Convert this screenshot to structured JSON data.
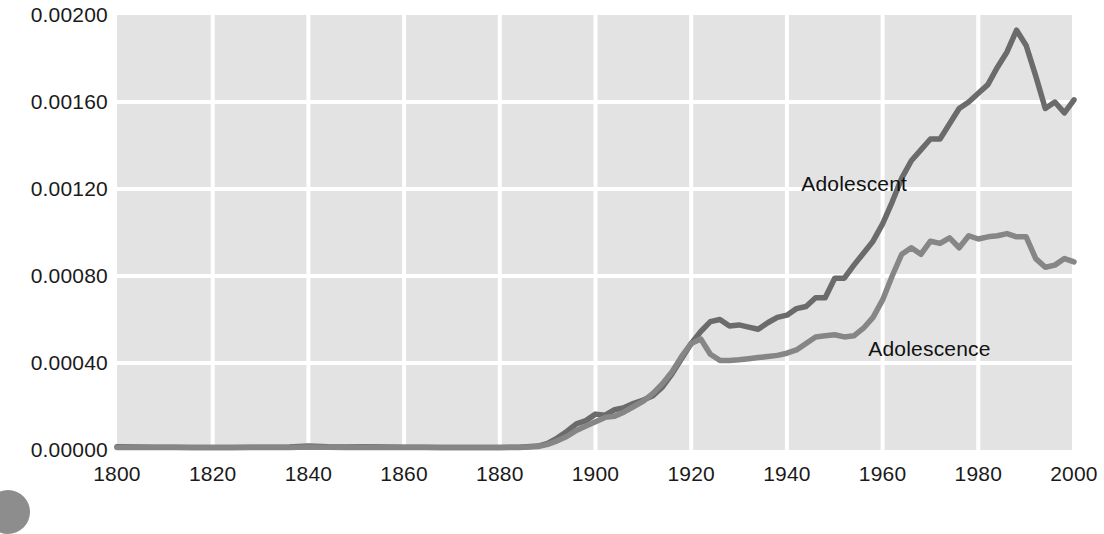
{
  "chart_data": {
    "type": "line",
    "title": "",
    "subtitle": "",
    "xlabel": "",
    "ylabel": "",
    "xlim": [
      1800,
      2000
    ],
    "ylim": [
      0.0,
      0.002
    ],
    "grid": true,
    "legend_position": "inline-annotation",
    "plot_bg_color": "#e3e3e3",
    "grid_color": "#ffffff",
    "xticks": [
      1800,
      1820,
      1840,
      1860,
      1880,
      1900,
      1920,
      1940,
      1960,
      1980,
      2000
    ],
    "xtick_labels": [
      "1800",
      "1820",
      "1840",
      "1860",
      "1880",
      "1900",
      "1920",
      "1940",
      "1960",
      "1980",
      "2000"
    ],
    "yticks": [
      0.0,
      0.0004,
      0.0008,
      0.0012,
      0.0016,
      0.002
    ],
    "ytick_labels": [
      "0.00000",
      "0.00040",
      "0.00080",
      "0.00120",
      "0.00160",
      "0.00200"
    ],
    "annotations": [
      {
        "text": "Adolescent",
        "x": 1943,
        "y": 0.00122,
        "name": "series-label-adolescent"
      },
      {
        "text": "Adolescence",
        "x": 1957,
        "y": 0.00046,
        "name": "series-label-adolescence"
      }
    ],
    "series": [
      {
        "name": "Adolescent",
        "color": "#6b6b6b",
        "x": [
          1800,
          1804,
          1808,
          1812,
          1816,
          1820,
          1824,
          1828,
          1832,
          1836,
          1840,
          1844,
          1848,
          1852,
          1856,
          1860,
          1864,
          1868,
          1872,
          1876,
          1880,
          1884,
          1888,
          1890,
          1892,
          1894,
          1896,
          1898,
          1900,
          1902,
          1904,
          1906,
          1908,
          1910,
          1912,
          1914,
          1916,
          1918,
          1920,
          1922,
          1924,
          1926,
          1928,
          1930,
          1932,
          1934,
          1936,
          1938,
          1940,
          1942,
          1944,
          1946,
          1948,
          1950,
          1952,
          1954,
          1956,
          1958,
          1960,
          1962,
          1964,
          1966,
          1968,
          1970,
          1972,
          1974,
          1976,
          1978,
          1980,
          1982,
          1984,
          1986,
          1988,
          1990,
          1992,
          1994,
          1996,
          1998,
          2000
        ],
        "y": [
          1.5e-05,
          1.4e-05,
          1.3e-05,
          1.3e-05,
          1.2e-05,
          1.2e-05,
          1.2e-05,
          1.3e-05,
          1.3e-05,
          1.4e-05,
          1.8e-05,
          1.5e-05,
          1.4e-05,
          1.5e-05,
          1.4e-05,
          1.3e-05,
          1.3e-05,
          1.2e-05,
          1.2e-05,
          1.2e-05,
          1.2e-05,
          1.3e-05,
          1.8e-05,
          3e-05,
          5.5e-05,
          8.5e-05,
          0.00012,
          0.000135,
          0.000165,
          0.00016,
          0.000185,
          0.000195,
          0.000215,
          0.00023,
          0.00025,
          0.00029,
          0.00035,
          0.00042,
          0.00049,
          0.000545,
          0.00059,
          0.0006,
          0.00057,
          0.000575,
          0.000565,
          0.000555,
          0.000585,
          0.00061,
          0.00062,
          0.00065,
          0.00066,
          0.0007,
          0.0007,
          0.00079,
          0.00079,
          0.00085,
          0.000905,
          0.00096,
          0.00104,
          0.00114,
          0.00125,
          0.00133,
          0.00138,
          0.00143,
          0.00143,
          0.0015,
          0.00157,
          0.0016,
          0.00164,
          0.00168,
          0.00176,
          0.00183,
          0.00193,
          0.00186,
          0.00172,
          0.00157,
          0.0016,
          0.00155,
          0.00161
        ]
      },
      {
        "name": "Adolescence",
        "color": "#868686",
        "x": [
          1800,
          1804,
          1808,
          1812,
          1816,
          1820,
          1824,
          1828,
          1832,
          1836,
          1840,
          1844,
          1848,
          1852,
          1856,
          1860,
          1864,
          1868,
          1872,
          1876,
          1880,
          1884,
          1888,
          1890,
          1892,
          1894,
          1896,
          1898,
          1900,
          1902,
          1904,
          1906,
          1908,
          1910,
          1912,
          1914,
          1916,
          1918,
          1920,
          1922,
          1924,
          1926,
          1928,
          1930,
          1932,
          1934,
          1936,
          1938,
          1940,
          1942,
          1944,
          1946,
          1948,
          1950,
          1952,
          1954,
          1956,
          1958,
          1960,
          1962,
          1964,
          1966,
          1968,
          1970,
          1972,
          1974,
          1976,
          1978,
          1980,
          1982,
          1984,
          1986,
          1988,
          1990,
          1992,
          1994,
          1996,
          1998,
          2000
        ],
        "y": [
          1.2e-05,
          1.2e-05,
          1.1e-05,
          1.1e-05,
          1.1e-05,
          1.1e-05,
          1.1e-05,
          1.2e-05,
          1.2e-05,
          1.2e-05,
          1.4e-05,
          1.3e-05,
          1.2e-05,
          1.3e-05,
          1.2e-05,
          1.2e-05,
          1.1e-05,
          1.1e-05,
          1.1e-05,
          1.1e-05,
          1.1e-05,
          1.2e-05,
          1.6e-05,
          2.6e-05,
          4.2e-05,
          6.2e-05,
          9e-05,
          0.00011,
          0.00013,
          0.00015,
          0.000155,
          0.000175,
          0.0002,
          0.000225,
          0.00026,
          0.000305,
          0.00036,
          0.00043,
          0.00049,
          0.00051,
          0.00044,
          0.000412,
          0.000412,
          0.000415,
          0.00042,
          0.000425,
          0.00043,
          0.000435,
          0.000445,
          0.00046,
          0.00049,
          0.00052,
          0.000525,
          0.00053,
          0.00052,
          0.000525,
          0.00056,
          0.00061,
          0.00069,
          0.0008,
          0.0009,
          0.00093,
          0.0009,
          0.00096,
          0.00095,
          0.000975,
          0.00093,
          0.000985,
          0.00097,
          0.00098,
          0.000985,
          0.000995,
          0.00098,
          0.00098,
          0.00088,
          0.00084,
          0.00085,
          0.00088,
          0.000865
        ]
      }
    ]
  },
  "decoration": {
    "corner_dot_color": "#8d8d8d"
  }
}
